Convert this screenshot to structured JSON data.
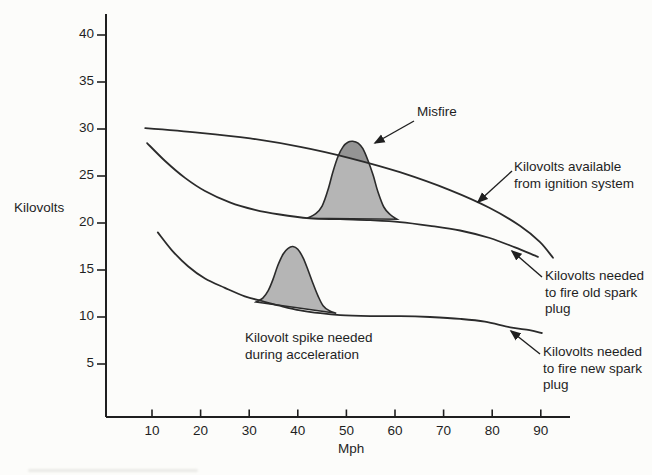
{
  "figure_name": "Spark plug firing voltage vs speed",
  "colors": {
    "background": "#fcfcfa",
    "line": "#2b2b2b",
    "axis": "#1f1f1f",
    "spike_fill": "#b5b5b5",
    "misfire_overlap_fill": "#949494"
  },
  "chart_data": {
    "type": "line",
    "title": "",
    "xlabel": "Mph",
    "ylabel": "Kilovolts",
    "x_ticks": [
      10,
      20,
      30,
      40,
      50,
      60,
      70,
      80,
      90
    ],
    "y_ticks": [
      5,
      10,
      15,
      20,
      25,
      30,
      35,
      40
    ],
    "xlim": [
      0,
      96
    ],
    "ylim": [
      0,
      42
    ],
    "grid": false,
    "legend_position": "none",
    "series": [
      {
        "name": "Kilovolts available from ignition system",
        "points": [
          [
            8.6,
            30.1
          ],
          [
            19.9,
            29.6
          ],
          [
            30.2,
            29.0
          ],
          [
            40.5,
            28.1
          ],
          [
            50.7,
            26.9
          ],
          [
            61.0,
            25.4
          ],
          [
            71.3,
            23.5
          ],
          [
            79.5,
            21.6
          ],
          [
            85.7,
            19.7
          ],
          [
            89.8,
            18.0
          ],
          [
            92.5,
            16.3
          ]
        ]
      },
      {
        "name": "Kilovolts needed to fire old spark plug",
        "points": [
          [
            9.0,
            28.5
          ],
          [
            12.7,
            26.6
          ],
          [
            16.8,
            24.8
          ],
          [
            20.9,
            23.4
          ],
          [
            26.0,
            22.2
          ],
          [
            31.2,
            21.4
          ],
          [
            36.3,
            20.9
          ],
          [
            42.5,
            20.5
          ],
          [
            48.7,
            20.4
          ],
          [
            54.9,
            20.3
          ],
          [
            61.0,
            20.1
          ],
          [
            67.2,
            19.7
          ],
          [
            73.4,
            19.2
          ],
          [
            79.5,
            18.4
          ],
          [
            84.7,
            17.4
          ],
          [
            89.4,
            16.4
          ]
        ]
      },
      {
        "name": "Kilovolts needed to fire new spark plug",
        "points": [
          [
            11.2,
            19.0
          ],
          [
            14.1,
            17.1
          ],
          [
            17.4,
            15.4
          ],
          [
            20.9,
            14.1
          ],
          [
            25.0,
            13.1
          ],
          [
            29.1,
            12.2
          ],
          [
            32.6,
            11.7
          ],
          [
            36.3,
            11.2
          ],
          [
            40.5,
            10.7
          ],
          [
            44.6,
            10.4
          ],
          [
            48.7,
            10.2
          ],
          [
            54.9,
            10.1
          ],
          [
            61.0,
            10.1
          ],
          [
            67.2,
            10.0
          ],
          [
            73.4,
            9.8
          ],
          [
            78.5,
            9.5
          ],
          [
            83.7,
            8.9
          ],
          [
            87.7,
            8.6
          ],
          [
            90.2,
            8.3
          ]
        ]
      }
    ],
    "filled_regions": [
      {
        "name": "Misfire spike (on old spark plug curve)",
        "peak_mph": 51,
        "peak_kv": 28.7,
        "darker_where": "above available-voltage curve",
        "points": [
          [
            41.9,
            20.5
          ],
          [
            43.7,
            21.0
          ],
          [
            45.0,
            21.8
          ],
          [
            46.2,
            23.5
          ],
          [
            47.2,
            25.4
          ],
          [
            48.3,
            27.1
          ],
          [
            49.3,
            28.1
          ],
          [
            50.3,
            28.6
          ],
          [
            51.3,
            28.7
          ],
          [
            52.4,
            28.5
          ],
          [
            53.4,
            27.9
          ],
          [
            54.4,
            26.7
          ],
          [
            55.5,
            25.1
          ],
          [
            56.5,
            23.3
          ],
          [
            57.7,
            21.7
          ],
          [
            59.0,
            20.9
          ],
          [
            60.4,
            20.4
          ]
        ]
      },
      {
        "name": "Kilovolt spike needed during acceleration (on new spark plug curve)",
        "peak_mph": 39,
        "peak_kv": 17.5,
        "points": [
          [
            31.4,
            11.6
          ],
          [
            32.8,
            12.0
          ],
          [
            33.9,
            12.8
          ],
          [
            34.9,
            14.0
          ],
          [
            35.9,
            15.5
          ],
          [
            37.0,
            16.7
          ],
          [
            38.0,
            17.3
          ],
          [
            39.0,
            17.5
          ],
          [
            40.0,
            17.2
          ],
          [
            41.1,
            16.3
          ],
          [
            42.1,
            15.0
          ],
          [
            43.1,
            13.6
          ],
          [
            44.2,
            12.2
          ],
          [
            45.2,
            11.2
          ],
          [
            46.4,
            10.7
          ],
          [
            47.9,
            10.4
          ]
        ]
      }
    ]
  },
  "annotations": {
    "misfire": "Misfire",
    "available": "Kilovolts available\nfrom ignition system",
    "old_plug": "Kilovolts needed\nto fire old spark\nplug",
    "new_plug": "Kilovolts needed\nto fire new spark\nplug",
    "accel": "Kilovolt spike needed\nduring acceleration"
  }
}
